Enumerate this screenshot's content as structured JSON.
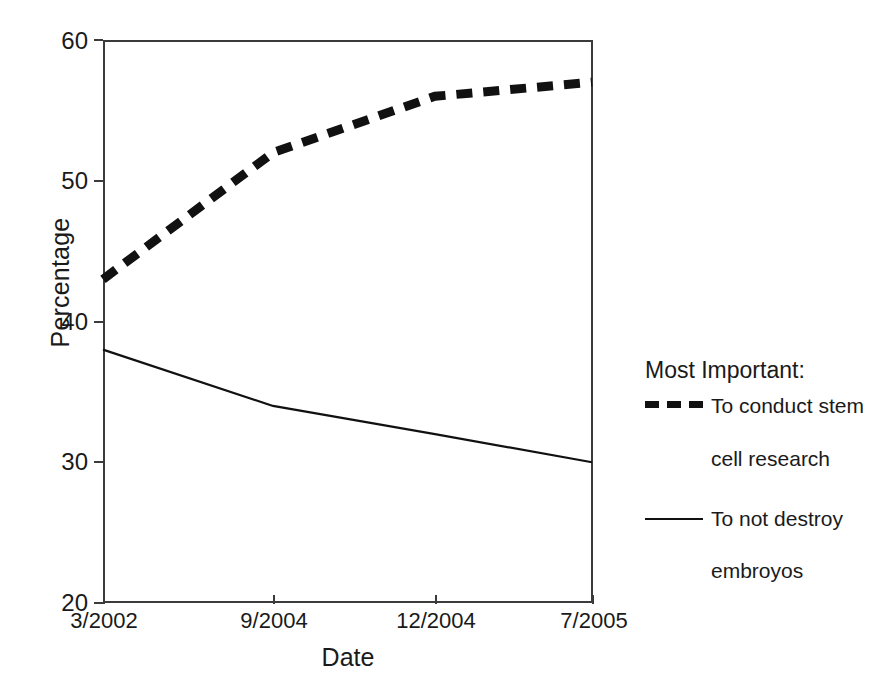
{
  "chart_data": {
    "type": "line",
    "title": "",
    "xlabel": "Date",
    "ylabel": "Percentage",
    "categories": [
      "3/2002",
      "9/2004",
      "12/2004",
      "7/2005"
    ],
    "ylim": [
      20,
      60
    ],
    "yticks": [
      20,
      30,
      40,
      50,
      60
    ],
    "ytick_labels": [
      "20",
      "30",
      "40",
      "50",
      "60"
    ],
    "xtick_labels": [
      "3/2002",
      "9/2004",
      "12/2004",
      "7/2005"
    ],
    "grid": false,
    "legend_position": "right",
    "legend_title": "Most Important:",
    "series": [
      {
        "name": "To conduct stem cell research",
        "name_line1": "To conduct stem",
        "name_line2": "cell research",
        "style": "dashed",
        "color": "#111111",
        "values": [
          43,
          52,
          56,
          57
        ]
      },
      {
        "name": "To not destroy embroyos",
        "name_line1": "To not destroy",
        "name_line2": "embroyos",
        "style": "solid",
        "color": "#111111",
        "values": [
          38,
          34,
          32,
          30
        ]
      }
    ]
  },
  "axes": {
    "y_title": "Percentage",
    "x_title": "Date",
    "y_labels": [
      "60",
      "50",
      "40",
      "30",
      "20"
    ],
    "x_labels": [
      "3/2002",
      "9/2004",
      "12/2004",
      "7/2005"
    ]
  },
  "legend": {
    "title": "Most Important:",
    "entries": [
      {
        "line1": "To conduct stem",
        "line2": "cell research"
      },
      {
        "line1": "To not destroy",
        "line2": "embroyos"
      }
    ]
  },
  "colors": {
    "axis": "#3b3b3b",
    "series": "#111111",
    "background": "#ffffff"
  }
}
